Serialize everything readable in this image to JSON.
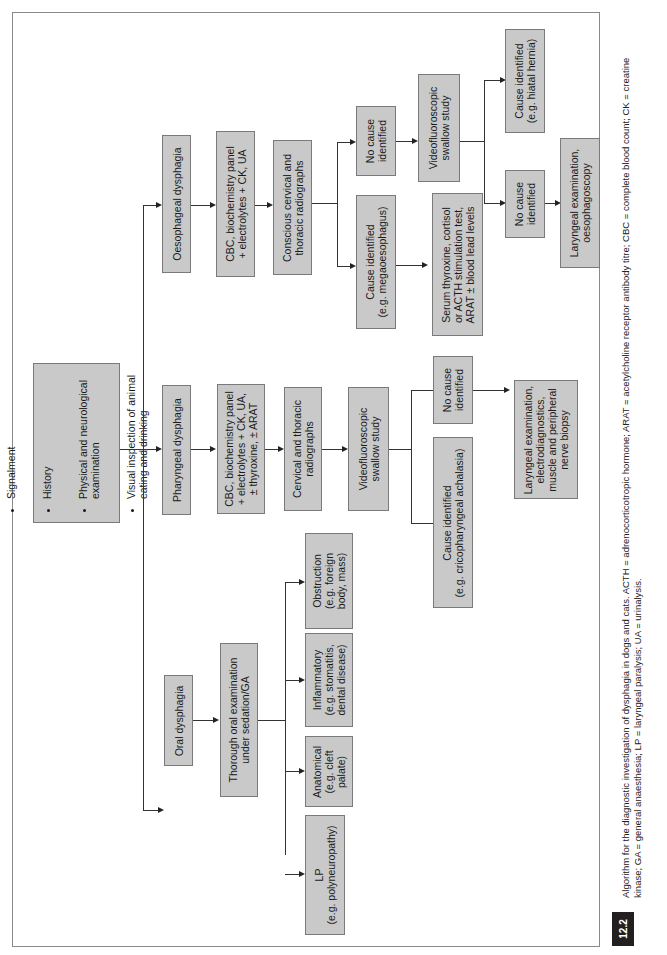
{
  "figure": {
    "number": "12.2",
    "caption_line1": "Algorithm for the diagnostic investigation of dysphagia in dogs and cats. ACTH = adrenocorticotropic hormone; ARAT = acetylcholine receptor antibody titre; CBC = complete blood count; CK = creatine",
    "caption_line2": "kinase; GA = general anaesthesia; LP = laryngeal paralysis; UA = urinalysis."
  },
  "start": {
    "items": [
      "Signalment",
      "History",
      "Physical and neurological\nexamination",
      "Visual inspection of animal\neating and drinking"
    ]
  },
  "branches": {
    "oesophageal": {
      "label": "Oesophageal dysphagia",
      "tests": "CBC, biochemistry panel\n+ electrolytes + CK, UA",
      "radiographs": "Conscious cervical and\nthoracic radiographs",
      "cause_identified": "Cause identified\n(e.g. megaoesophagus)",
      "cause_followup": "Serum thyroxine, cortisol\nor ACTH stimulation test,\nARAT ± blood lead levels",
      "no_cause": "No cause\nidentified",
      "swallow_study": "Videofluoroscopic\nswallow study",
      "swallow_cause": "Cause identified\n(e.g. hiatal hernia)",
      "swallow_no_cause": "No cause\nidentified",
      "final": "Laryngeal examination,\noesophagoscopy"
    },
    "pharyngeal": {
      "label": "Pharyngeal dysphagia",
      "tests": "CBC, biochemistry panel\n+ electrolytes + CK, UA,\n± thyroxine, ± ARAT",
      "radiographs": "Cervical and thoracic\nradiographs",
      "swallow_study": "Videofluoroscopic\nswallow study",
      "cause_identified": "Cause identified\n(e.g. cricopharyngeal achalasia)",
      "no_cause": "No cause\nidentified",
      "final": "Laryngeal examination,\nelectrodiagnostics,\nmuscle and peripheral\nnerve biopsy"
    },
    "oral": {
      "label": "Oral dysphagia",
      "exam": "Thorough oral examination\nunder sedation/GA",
      "outcomes": [
        "LP\n(e.g. polyneuropathy)",
        "Anatomical\n(e.g. cleft\npalate)",
        "Inflammatory\n(e.g. stomatitis,\ndental disease)",
        "Obstruction\n(e.g. foreign\nbody, mass)"
      ]
    }
  },
  "colors": {
    "box_fill": "#c9c9c9",
    "box_border": "#7a7a7a",
    "line": "#333333",
    "fignum_bg": "#231f20"
  }
}
